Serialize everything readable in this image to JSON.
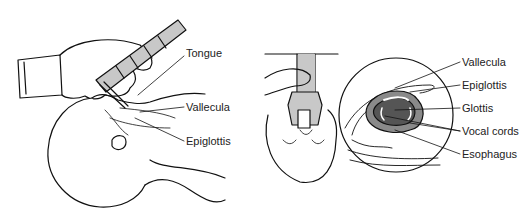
{
  "diagram": {
    "left_panel": {
      "description": "Infant laryngoscopy, side view",
      "labels": [
        {
          "text": "Tongue",
          "x": 186,
          "y": 52
        },
        {
          "text": "Vallecula",
          "x": 186,
          "y": 103
        },
        {
          "text": "Epiglottis",
          "x": 186,
          "y": 137
        }
      ]
    },
    "right_panel": {
      "description": "Top view with magnified laryngeal inlet",
      "labels": [
        {
          "text": "Vallecula",
          "x": 462,
          "y": 56
        },
        {
          "text": "Epiglottis",
          "x": 462,
          "y": 79
        },
        {
          "text": "Glottis",
          "x": 462,
          "y": 102
        },
        {
          "text": "Vocal cords",
          "x": 462,
          "y": 126
        },
        {
          "text": "Esophagus",
          "x": 462,
          "y": 149
        }
      ]
    },
    "colors": {
      "line": "#111111",
      "fill_light": "#c8c8c8",
      "fill_mid": "#8a8a8a",
      "fill_dark": "#555555"
    }
  }
}
